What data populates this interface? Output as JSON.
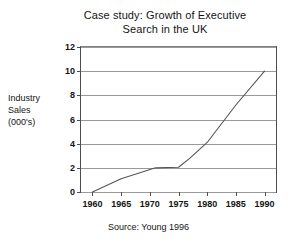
{
  "chart_data": {
    "type": "line",
    "title": "Case study: Growth of Executive Search in the UK",
    "title_lines": [
      "Case study: Growth of Executive",
      "Search in the UK"
    ],
    "xlabel": "",
    "ylabel": "Industry Sales (000's)",
    "ylabel_lines": [
      "Industry",
      "Sales",
      "(000's)"
    ],
    "source": "Source: Young 1996",
    "grid": "horizontal",
    "legend": "none",
    "xlim": [
      1958,
      1992
    ],
    "ylim": [
      0,
      12
    ],
    "xticks": [
      1960,
      1965,
      1970,
      1975,
      1980,
      1985,
      1990
    ],
    "yticks": [
      0,
      2,
      4,
      6,
      8,
      10,
      12
    ],
    "xtick_labels": [
      "1960",
      "1965",
      "1970",
      "1975",
      "1980",
      "1985",
      "1990"
    ],
    "ytick_labels": [
      "0",
      "2",
      "4",
      "6",
      "8",
      "10",
      "12"
    ],
    "series": [
      {
        "name": "Industry Sales",
        "color": "#555555",
        "x": [
          1960,
          1965,
          1971,
          1975,
          1977,
          1980,
          1985,
          1990
        ],
        "values": [
          0,
          1.1,
          2.0,
          2.05,
          2.8,
          4.1,
          7.2,
          10.0
        ]
      }
    ]
  },
  "colors": {
    "grid": "#999999",
    "axis": "#4d4d4d",
    "line": "#555555",
    "text": "#141414",
    "background": "#ffffff"
  }
}
